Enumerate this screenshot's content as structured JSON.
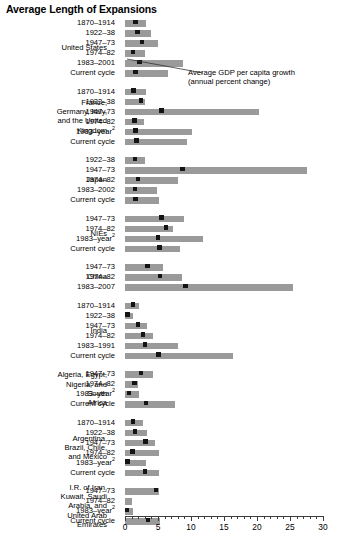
{
  "title": "Average Length of Expansions",
  "annotation": {
    "line1": "Average GDP per capita growth",
    "line2": "(annual percent change)"
  },
  "axis": {
    "ticks": [
      "0",
      "5",
      "10",
      "15",
      "20",
      "25",
      "30"
    ],
    "min": 0,
    "max": 30
  },
  "chart_data": {
    "type": "bar",
    "title": "Average Length of Expansions",
    "xlabel": "",
    "ylabel": "",
    "xlim": [
      0,
      30
    ],
    "grid": false,
    "legend": "none",
    "annotation": "Average GDP per capita growth (annual percent change)",
    "note": "Bar length = average length of expansions (years); black square marker = average GDP per capita growth (annual percent change)",
    "groups": [
      {
        "name": "United States",
        "rows": [
          {
            "period": "1870–1914",
            "length": 3.2,
            "growth": 1.6
          },
          {
            "period": "1922–38",
            "length": 4.0,
            "growth": 1.9
          },
          {
            "period": "1947–73",
            "length": 5.0,
            "growth": 2.6
          },
          {
            "period": "1974–82",
            "length": 3.0,
            "growth": 1.2
          },
          {
            "period": "1983–2001",
            "length": 8.8,
            "growth": 2.2
          },
          {
            "period": "Current cycle",
            "length": 6.5,
            "growth": 1.6
          }
        ]
      },
      {
        "name": "France, Germany, Italy, and the United Kingdom",
        "rows": [
          {
            "period": "1870–1914",
            "length": 3.2,
            "growth": 1.3
          },
          {
            "period": "1922–38",
            "length": 3.0,
            "growth": 2.4
          },
          {
            "period": "1947–73",
            "length": 20.3,
            "growth": 5.5
          },
          {
            "period": "1974–82",
            "length": 2.9,
            "growth": 1.4
          },
          {
            "period": "1983–year²",
            "length": 10.2,
            "growth": 1.6
          },
          {
            "period": "Current cycle",
            "length": 9.4,
            "growth": 1.7
          }
        ]
      },
      {
        "name": "Japan",
        "rows": [
          {
            "period": "1922–38",
            "length": 3.0,
            "growth": 1.5
          },
          {
            "period": "1947–73",
            "length": 27.6,
            "growth": 8.7
          },
          {
            "period": "1974–82",
            "length": 8.1,
            "growth": 2.0
          },
          {
            "period": "1983–2002",
            "length": 4.8,
            "growth": 1.5
          },
          {
            "period": "Current cycle",
            "length": 5.2,
            "growth": 1.6
          }
        ]
      },
      {
        "name": "NIEs",
        "rows": [
          {
            "period": "1947–73",
            "length": 9.0,
            "growth": 5.5
          },
          {
            "period": "1974–82",
            "length": 7.3,
            "growth": 6.2
          },
          {
            "period": "1983–year²",
            "length": 11.8,
            "growth": 5.0
          },
          {
            "period": "Current cycle",
            "length": 8.3,
            "growth": 5.2
          }
        ]
      },
      {
        "name": "China",
        "rows": [
          {
            "period": "1947–73",
            "length": 5.8,
            "growth": 3.4
          },
          {
            "period": "1974–82",
            "length": 8.6,
            "growth": 5.3
          },
          {
            "period": "1983–2007",
            "length": 25.5,
            "growth": 9.2
          }
        ]
      },
      {
        "name": "India",
        "rows": [
          {
            "period": "1870–1914",
            "length": 2.1,
            "growth": 1.2
          },
          {
            "period": "1922–38",
            "length": 1.2,
            "growth": 0.4
          },
          {
            "period": "1947–73",
            "length": 3.3,
            "growth": 2.0
          },
          {
            "period": "1974–82",
            "length": 4.2,
            "growth": 2.7
          },
          {
            "period": "1983–1991",
            "length": 8.1,
            "growth": 3.0
          },
          {
            "period": "Current cycle",
            "length": 16.3,
            "growth": 5.1
          }
        ]
      },
      {
        "name": "Algeria, Egypt, Nigeria, and South Africa",
        "rows": [
          {
            "period": "1947–73",
            "length": 4.2,
            "growth": 2.4
          },
          {
            "period": "1974–82",
            "length": 2.0,
            "growth": 1.4
          },
          {
            "period": "1983–year²",
            "length": 2.1,
            "growth": 0.6
          },
          {
            "period": "Current cycle",
            "length": 7.5,
            "growth": 3.2
          }
        ]
      },
      {
        "name": "Argentina, Brazil, Chile, and Mexico",
        "rows": [
          {
            "period": "1870–1914",
            "length": 2.8,
            "growth": 1.2
          },
          {
            "period": "1922–38",
            "length": 3.4,
            "growth": 1.5
          },
          {
            "period": "1947–73",
            "length": 4.6,
            "growth": 3.1
          },
          {
            "period": "1974–82",
            "length": 5.2,
            "growth": 1.1
          },
          {
            "period": "1983–year²",
            "length": 3.2,
            "growth": 0.4
          },
          {
            "period": "Current cycle",
            "length": 5.1,
            "growth": 3.0
          }
        ]
      },
      {
        "name": "I.R. of Iran, Kuwait, Saudi Arabia, and United Arab Emirates",
        "rows": [
          {
            "period": "1947–73",
            "length": 5.1,
            "growth": 4.7
          },
          {
            "period": "1974–82",
            "length": 1.1,
            "growth": null
          },
          {
            "period": "1983–year²",
            "length": 1.2,
            "growth": 0.3
          },
          {
            "period": "Current cycle",
            "length": 5.3,
            "growth": 3.5
          }
        ]
      }
    ]
  },
  "group_label_lines": {
    "United States": [
      "United States"
    ],
    "France, Germany, Italy, and the United Kingdom": [
      "France,",
      "Germany, Italy,",
      "and the United",
      "Kingdom"
    ],
    "Japan": [
      "Japan"
    ],
    "NIEs": [
      "NIEs"
    ],
    "China": [
      "China"
    ],
    "India": [
      "India"
    ],
    "Algeria, Egypt, Nigeria, and South Africa": [
      "Algeria, Egypt,",
      "Nigeria, and",
      "South",
      "Africa"
    ],
    "Argentina, Brazil, Chile, and Mexico": [
      "Argentina,",
      "Brazil, Chile,",
      "and Mexico"
    ],
    "I.R. of Iran, Kuwait, Saudi Arabia, and United Arab Emirates": [
      "I.R. of Iran,",
      "Kuwait, Saudi",
      "Arabia, and",
      "United Arab",
      "Emirates"
    ]
  }
}
